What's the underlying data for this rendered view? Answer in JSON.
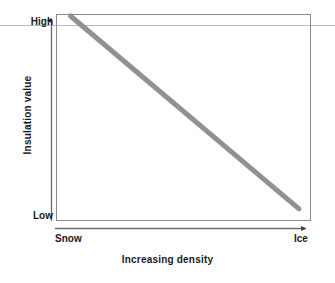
{
  "chart_data": {
    "type": "line",
    "title": "",
    "xlabel": "Increasing density",
    "ylabel": "Insulation value",
    "x_tick_labels": [
      "Snow",
      "Ice"
    ],
    "y_tick_labels": [
      "High",
      "Low"
    ],
    "xlim_labels": [
      "Snow",
      "Ice"
    ],
    "ylim_labels": [
      "Low",
      "High"
    ],
    "grid": false,
    "legend": "none",
    "annotations": [],
    "series": [
      {
        "name": "Insulation value vs density",
        "color": "#919191",
        "line_width_px": 5,
        "x": [
          "Snow",
          "Ice"
        ],
        "y": [
          "High",
          "Low"
        ],
        "points_normalized": [
          {
            "x": 0.05,
            "y": 1.0
          },
          {
            "x": 0.96,
            "y": 0.05
          }
        ],
        "description": "Insulation value decreases steadily and linearly as density increases from snow to ice."
      }
    ],
    "axes": {
      "x_axis_arrow": "right",
      "y_axis_arrow": "up",
      "frame": true,
      "frame_color": "#8a8a8a"
    }
  },
  "figure": {
    "y_axis_title": "Insulation value",
    "x_axis_title": "Increasing density",
    "y_top_label": "High",
    "y_bottom_label": "Low",
    "x_left_label": "Snow",
    "x_right_label": "Ice",
    "colors": {
      "trend_line": "#919191",
      "frame": "#8a8a8a",
      "axis": "#6b6b6b",
      "rule": "#b9b9b9",
      "text": "#1a1a1a",
      "background": "#ffffff"
    }
  }
}
